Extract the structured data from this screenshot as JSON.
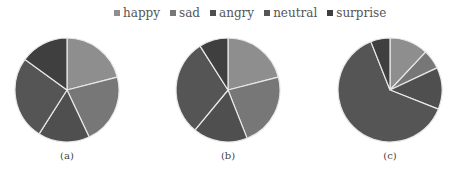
{
  "chart_data": [
    {
      "type": "pie",
      "title": "(a)",
      "categories": [
        "happy",
        "sad",
        "angry",
        "neutral",
        "surprise"
      ],
      "values": [
        21,
        22,
        16,
        26,
        15
      ],
      "start_angle": "12 o'clock, clockwise",
      "legend_position": "top"
    },
    {
      "type": "pie",
      "title": "(b)",
      "categories": [
        "happy",
        "sad",
        "angry",
        "neutral",
        "surprise"
      ],
      "values": [
        21,
        23,
        17,
        30,
        9
      ],
      "start_angle": "12 o'clock, clockwise",
      "legend_position": "top"
    },
    {
      "type": "pie",
      "title": "(c)",
      "categories": [
        "happy",
        "sad",
        "angry",
        "neutral",
        "surprise"
      ],
      "values": [
        12,
        6,
        13,
        63,
        6
      ],
      "start_angle": "12 o'clock, clockwise",
      "legend_position": "top"
    }
  ],
  "legend": [
    {
      "label": "happy",
      "color": "#8e8e8e"
    },
    {
      "label": "sad",
      "color": "#777777"
    },
    {
      "label": "angry",
      "color": "#4f4f4f"
    },
    {
      "label": "neutral",
      "color": "#555555"
    },
    {
      "label": "surprise",
      "color": "#3f3f3f"
    }
  ],
  "captions": [
    "(a)",
    "(b)",
    "(c)"
  ]
}
